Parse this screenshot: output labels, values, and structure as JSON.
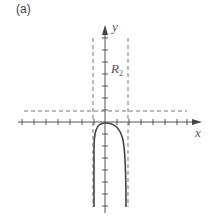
{
  "panel_label": "(a)",
  "axes": {
    "x_label": "x",
    "y_label": "y",
    "origin_px": [
      105,
      122
    ],
    "tick_spacing_px": 12
  },
  "region_label": "R",
  "region_subscript": "2",
  "asymptotes": {
    "vertical_left_px": 93,
    "vertical_right_px": 128,
    "horizontal_px": 111
  },
  "colors": {
    "axis": "#555555",
    "curve": "#444444",
    "dashed": "#777777"
  }
}
